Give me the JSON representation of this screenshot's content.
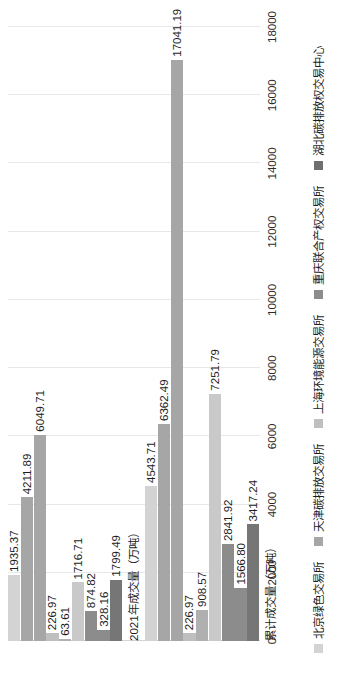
{
  "chart_data": {
    "type": "bar",
    "orientation": "horizontal-rotated",
    "title": "",
    "xlabel": "",
    "ylabel": "",
    "categories": [
      "2021年成交量（万吨）",
      "累计成交量（万吨）"
    ],
    "legend_position": "bottom",
    "grid": true,
    "ylim": [
      0,
      18000
    ],
    "ticks": [
      "0",
      "2000",
      "4000",
      "6000",
      "8000",
      "10000",
      "12000",
      "14000",
      "16000",
      "18000"
    ],
    "tick_values": [
      0,
      2000,
      4000,
      6000,
      8000,
      10000,
      12000,
      14000,
      16000,
      18000
    ],
    "series": [
      {
        "name": "北京绿色交易所",
        "color": "#d3d3d3",
        "values": [
          1935.37,
          4543.71
        ],
        "labels": [
          "1935.37",
          "4543.71"
        ]
      },
      {
        "name": "天津碳排放交易所",
        "color": "#a6a6a6",
        "values": [
          4211.89,
          6362.49
        ],
        "labels": [
          "4211.89",
          "6362.49"
        ]
      },
      {
        "name": "上海环境能源交易所",
        "color": "#a6a6a6",
        "values": [
          6049.71,
          17041.19
        ],
        "labels": [
          "6049.71",
          "17041.19"
        ]
      },
      {
        "name": "重庆联合产权交易所",
        "color": "#bfbfbf",
        "values": [
          226.97,
          226.97
        ],
        "labels": [
          "226.97",
          "226.97"
        ]
      },
      {
        "name": "湖北碳排放权交易中心",
        "color": "#b0b0b0",
        "values": [
          63.61,
          908.57
        ],
        "labels": [
          "63.61",
          "908.57"
        ]
      },
      {
        "name": "series-6",
        "color": "#c9c9c9",
        "values": [
          1716.71,
          7251.79
        ],
        "labels": [
          "1716.71",
          "7251.79"
        ]
      },
      {
        "name": "series-7",
        "color": "#8c8c8c",
        "values": [
          874.82,
          2841.92
        ],
        "labels": [
          "874.82",
          "2841.92"
        ]
      },
      {
        "name": "series-8",
        "color": "#8c8c8c",
        "values": [
          328.16,
          1566.8
        ],
        "labels": [
          "328.16",
          "1566.80"
        ]
      },
      {
        "name": "series-9",
        "color": "#767676",
        "values": [
          1799.49,
          3417.24
        ],
        "labels": [
          "1799.49",
          "3417.24"
        ]
      }
    ]
  },
  "legend": {
    "items": [
      {
        "label": "北京绿色交易所",
        "color": "#d3d3d3"
      },
      {
        "label": "天津碳排放交易所",
        "color": "#a6a6a6"
      },
      {
        "label": "上海环境能源交易所",
        "color": "#bfbfbf"
      },
      {
        "label": "重庆联合产权交易所",
        "color": "#8c8c8c"
      },
      {
        "label": "湖北碳排放权交易中心",
        "color": "#6f6f6f"
      }
    ]
  }
}
